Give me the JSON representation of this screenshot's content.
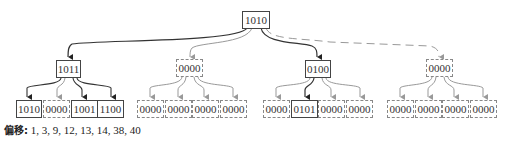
{
  "diagram": {
    "root": {
      "value": "1010",
      "style": "solid"
    },
    "level1": [
      {
        "value": "1011",
        "style": "solid"
      },
      {
        "value": "0000",
        "style": "dashed"
      },
      {
        "value": "0100",
        "style": "solid"
      },
      {
        "value": "0000",
        "style": "dashed"
      }
    ],
    "level2": [
      [
        {
          "value": "1010",
          "style": "solid"
        },
        {
          "value": "0000",
          "style": "dashed"
        },
        {
          "value": "1001",
          "style": "solid"
        },
        {
          "value": "1100",
          "style": "solid"
        }
      ],
      [
        {
          "value": "0000",
          "style": "dashed"
        },
        {
          "value": "0000",
          "style": "dashed"
        },
        {
          "value": "0000",
          "style": "dashed"
        },
        {
          "value": "0000",
          "style": "dashed"
        }
      ],
      [
        {
          "value": "0000",
          "style": "dashed"
        },
        {
          "value": "0101",
          "style": "solid"
        },
        {
          "value": "0000",
          "style": "dashed"
        },
        {
          "value": "0000",
          "style": "dashed"
        }
      ],
      [
        {
          "value": "0000",
          "style": "dashed"
        },
        {
          "value": "0000",
          "style": "dashed"
        },
        {
          "value": "0000",
          "style": "dashed"
        },
        {
          "value": "0000",
          "style": "dashed"
        }
      ]
    ]
  },
  "caption": {
    "label": "偏移:",
    "values": "1, 3, 9, 12, 13, 14, 38, 40"
  },
  "colors": {
    "solid_line": "#333333",
    "dashed_line": "#999999"
  }
}
